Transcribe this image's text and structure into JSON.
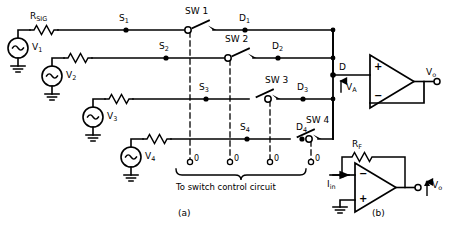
{
  "figure": {
    "title_a": "(a)",
    "title_b": "(b)",
    "caption": "To switch control circuit"
  },
  "colors": {
    "wire": "#000000",
    "background": "#ffffff",
    "dashed_control": "#000000"
  },
  "panel_a": {
    "resistors": [
      {
        "name": "R_SIG",
        "label": "R",
        "sub": "SIG"
      }
    ],
    "sources": [
      {
        "name": "V1",
        "label": "V",
        "sub": "1",
        "symbol": "ac-sine"
      },
      {
        "name": "V2",
        "label": "V",
        "sub": "2",
        "symbol": "ac-sine"
      },
      {
        "name": "V3",
        "label": "V",
        "sub": "3",
        "symbol": "ac-sine"
      },
      {
        "name": "V4",
        "label": "V",
        "sub": "4",
        "symbol": "ac-sine"
      }
    ],
    "source_nodes": [
      {
        "name": "S1",
        "label": "S",
        "sub": "1"
      },
      {
        "name": "S2",
        "label": "S",
        "sub": "2"
      },
      {
        "name": "S3",
        "label": "S",
        "sub": "3"
      },
      {
        "name": "S4",
        "label": "S",
        "sub": "4"
      }
    ],
    "switches": [
      {
        "name": "SW1",
        "label": "SW 1",
        "state": "open"
      },
      {
        "name": "SW2",
        "label": "SW 2",
        "state": "open"
      },
      {
        "name": "SW3",
        "label": "SW 3",
        "state": "open"
      },
      {
        "name": "SW4",
        "label": "SW 4",
        "state": "open"
      }
    ],
    "drain_nodes": [
      {
        "name": "D1",
        "label": "D",
        "sub": "1"
      },
      {
        "name": "D2",
        "label": "D",
        "sub": "2"
      },
      {
        "name": "D3",
        "label": "D",
        "sub": "3"
      },
      {
        "name": "D4",
        "label": "D",
        "sub": "4"
      }
    ],
    "control_terminals": [
      {
        "name": "ctrl-1",
        "label": "0"
      },
      {
        "name": "ctrl-2",
        "label": "0"
      },
      {
        "name": "ctrl-3",
        "label": "0"
      },
      {
        "name": "ctrl-4",
        "label": "0"
      }
    ],
    "bus_node": {
      "label": "D"
    },
    "bus_voltage": {
      "label": "V",
      "sub": "A"
    },
    "opamp": {
      "plus": "+",
      "minus": "−",
      "config": "voltage-follower"
    },
    "output": {
      "label": "V",
      "sub": "o"
    }
  },
  "panel_b": {
    "feedback_resistor": {
      "label": "R",
      "sub": "F"
    },
    "input_current": {
      "label": "I",
      "sub": "in"
    },
    "opamp": {
      "plus": "+",
      "minus": "−",
      "config": "inverting-current-to-voltage"
    },
    "output": {
      "label": "V",
      "sub": "o"
    }
  }
}
